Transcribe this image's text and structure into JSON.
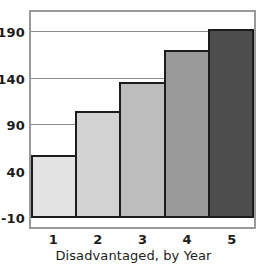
{
  "chart_data": {
    "type": "bar",
    "title": "",
    "subtitle": "",
    "xlabel": "Disadvantaged, by Year",
    "ylabel": "",
    "categories": [
      "1",
      "2",
      "3",
      "4",
      "5"
    ],
    "values": [
      58,
      105,
      137,
      171,
      194
    ],
    "series": [
      {
        "name": "Disadvantaged",
        "values": [
          58,
          105,
          137,
          171,
          194
        ]
      }
    ],
    "ylim": [
      -10,
      212
    ],
    "xlim": [
      0.5,
      5.5
    ],
    "y_ticks": [
      -10,
      40,
      90,
      140,
      190
    ],
    "y_tick_labels": [
      "-10",
      "40",
      "90",
      "140",
      "190"
    ],
    "x_tick_labels": [
      "1",
      "2",
      "3",
      "4",
      "5"
    ],
    "grid": {
      "horizontal": true,
      "vertical": false,
      "color": "#8d8d8d"
    },
    "legend": {
      "visible": false,
      "position": "none",
      "entries": []
    },
    "annotations": [],
    "bar_colors": [
      "#e3e3e3",
      "#d2d2d2",
      "#bdbdbd",
      "#9a9a9a",
      "#4d4d4d"
    ],
    "bar_edge_color": "#1c1c1c",
    "axis_frame_color": "#9a9a9a",
    "baseline_color": "#1c1c1c",
    "background_color": "#ffffff",
    "text_color": "#1c1c1c"
  }
}
